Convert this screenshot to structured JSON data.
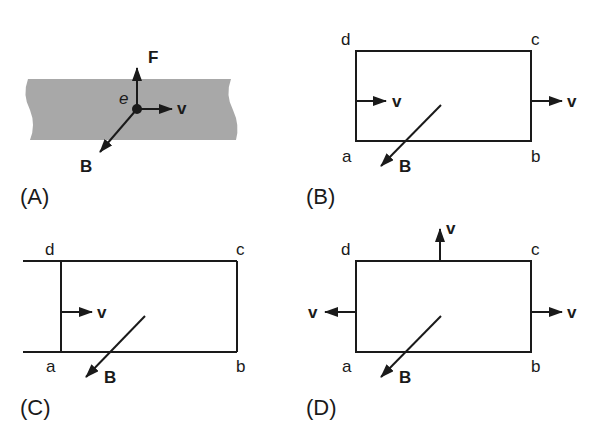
{
  "figure": {
    "panels": [
      {
        "id": "A",
        "label": "(A)",
        "charge_label": "e",
        "vectors": {
          "force": "F",
          "velocity": "v",
          "field": "B"
        }
      },
      {
        "id": "B",
        "label": "(B)",
        "corners": {
          "a": "a",
          "b": "b",
          "c": "c",
          "d": "d"
        },
        "velocity_labels": [
          "v",
          "v"
        ],
        "field_label": "B"
      },
      {
        "id": "C",
        "label": "(C)",
        "corners": {
          "a": "a",
          "b": "b",
          "c": "c",
          "d": "d"
        },
        "velocity_labels": [
          "v"
        ],
        "field_label": "B"
      },
      {
        "id": "D",
        "label": "(D)",
        "corners": {
          "a": "a",
          "b": "b",
          "c": "c",
          "d": "d"
        },
        "velocity_labels": [
          "v",
          "v",
          "v"
        ],
        "field_label": "B"
      }
    ],
    "colors": {
      "band": "#a8a8a8",
      "ink": "#1a1a1a",
      "background": "#ffffff"
    }
  }
}
